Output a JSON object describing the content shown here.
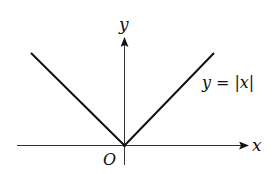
{
  "diagram": {
    "axes": {
      "x_label": "x",
      "y_label": "y",
      "origin_label": "O"
    },
    "curve": {
      "label_lhs": "y",
      "label_eq": "=",
      "label_rhs": "|x|",
      "function": "y = |x|"
    },
    "colors": {
      "axis": "#333333",
      "curve": "#111111",
      "background": "#ffffff"
    }
  }
}
